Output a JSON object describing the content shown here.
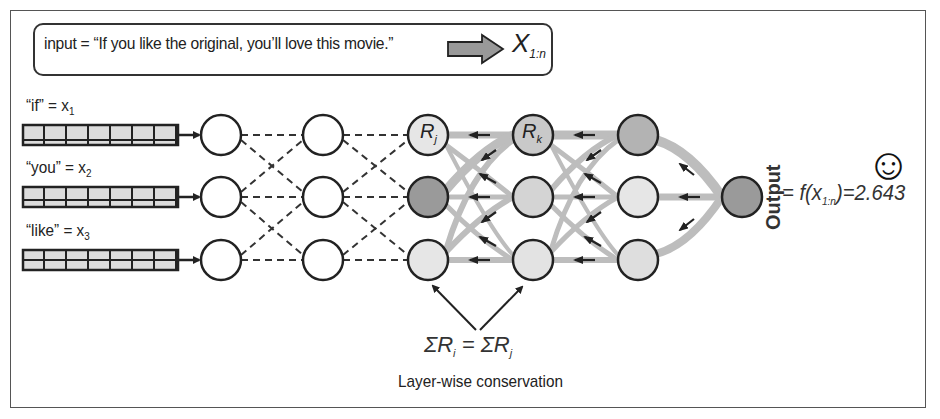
{
  "input_box": {
    "text": "input = “If you like the original, you’ll love this movie.”",
    "arrow": "thick-right-arrow",
    "result_symbol": "X",
    "result_subscript": "1:n"
  },
  "tokens": [
    {
      "word": "“if” = x",
      "index": "1",
      "vector_cells": 8
    },
    {
      "word": "“you” = x",
      "index": "2",
      "vector_cells": 8
    },
    {
      "word": "“like” = x",
      "index": "3",
      "vector_cells": 8
    }
  ],
  "node_labels": {
    "rj": {
      "symbol": "R",
      "subscript": "j"
    },
    "rk": {
      "symbol": "R",
      "subscript": "k"
    }
  },
  "output": {
    "label": "Output",
    "formula_prefix": "= f(x",
    "formula_subscript": "1:n",
    "formula_suffix": ")=2.643",
    "icon": "smiley-face-icon",
    "icon_glyph": "☺"
  },
  "conservation": {
    "lhs": "ΣR",
    "lhs_sub": "i",
    "lhs_idx": "i",
    "eq": " = ",
    "rhs": "ΣR",
    "rhs_sub": "j",
    "rhs_idx": "j",
    "caption": "Layer-wise conservation"
  },
  "colors": {
    "node_white": "#ffffff",
    "node_light": "#e6e6e6",
    "node_mid": "#c9c9c9",
    "node_dark": "#9a9a9a",
    "relevance_flow": "#bdbdbd",
    "stroke": "#222222"
  }
}
